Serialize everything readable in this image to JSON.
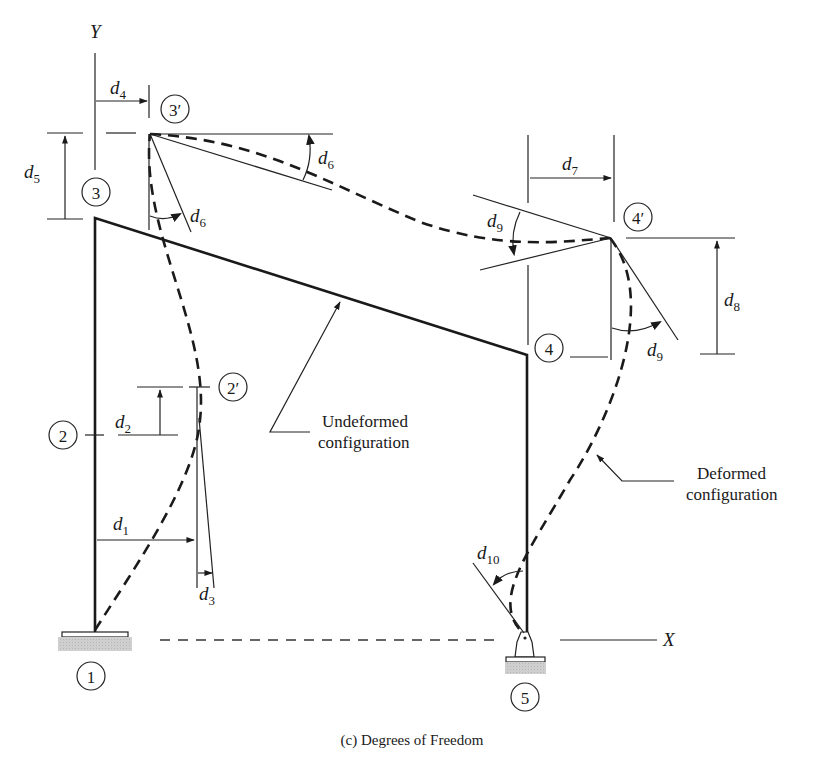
{
  "figure": {
    "caption": "(c) Degrees of Freedom",
    "axes": {
      "x_label": "X",
      "y_label": "Y"
    },
    "nodes": [
      {
        "id": "1",
        "label": "1"
      },
      {
        "id": "2",
        "label": "2"
      },
      {
        "id": "2p",
        "label": "2′"
      },
      {
        "id": "3",
        "label": "3"
      },
      {
        "id": "3p",
        "label": "3′"
      },
      {
        "id": "4",
        "label": "4"
      },
      {
        "id": "4p",
        "label": "4′"
      },
      {
        "id": "5",
        "label": "5"
      }
    ],
    "dofs": [
      {
        "sym": "d",
        "sub": "1"
      },
      {
        "sym": "d",
        "sub": "2"
      },
      {
        "sym": "d",
        "sub": "3"
      },
      {
        "sym": "d",
        "sub": "4"
      },
      {
        "sym": "d",
        "sub": "5"
      },
      {
        "sym": "d",
        "sub": "6"
      },
      {
        "sym": "d",
        "sub": "7"
      },
      {
        "sym": "d",
        "sub": "8"
      },
      {
        "sym": "d",
        "sub": "9"
      },
      {
        "sym": "d",
        "sub": "10"
      }
    ],
    "annotations": {
      "undeformed_line1": "Undeformed",
      "undeformed_line2": "configuration",
      "deformed_line1": "Deformed",
      "deformed_line2": "configuration"
    },
    "colors": {
      "ink": "#1a1a1a",
      "support_fill": "#c8c8c8"
    }
  }
}
